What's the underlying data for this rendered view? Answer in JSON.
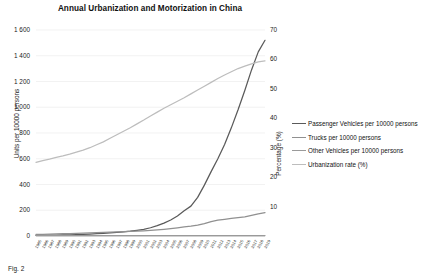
{
  "chart_data": {
    "type": "line",
    "title": "Annual Urbanization and Motorization in China",
    "xlabel": "",
    "ylabel": "Units per 10000 persons",
    "y2label": "Percentage (%)",
    "ylim": [
      0,
      1600
    ],
    "y2lim": [
      0,
      70
    ],
    "grid": true,
    "legend_position": "right",
    "y_ticks": [
      "0",
      "200",
      "400",
      "600",
      "800",
      "1 000",
      "1 200",
      "1 400",
      "1 600"
    ],
    "y2_ticks": [
      "10",
      "20",
      "30",
      "40",
      "50",
      "60",
      "70"
    ],
    "categories": [
      "1985",
      "1986",
      "1987",
      "1988",
      "1989",
      "1990",
      "1991",
      "1992",
      "1993",
      "1994",
      "1995",
      "1996",
      "1997",
      "1998",
      "1999",
      "2000",
      "2001",
      "2002",
      "2003",
      "2004",
      "2005",
      "2006",
      "2007",
      "2008",
      "2009",
      "2010",
      "2011",
      "2012",
      "2013",
      "2014",
      "2015",
      "2016",
      "2017",
      "2018",
      "2019"
    ],
    "series": [
      {
        "name": "Passenger Vehicles per 10000 persons",
        "axis": "left",
        "color": "#5a5a5a",
        "values": [
          4,
          5,
          6,
          7,
          8,
          9,
          10,
          12,
          15,
          18,
          21,
          24,
          28,
          32,
          37,
          44,
          52,
          64,
          80,
          100,
          124,
          155,
          196,
          232,
          300,
          395,
          500,
          600,
          710,
          840,
          980,
          1130,
          1290,
          1430,
          1520
        ]
      },
      {
        "name": "Trucks per 10000 persons",
        "axis": "left",
        "color": "#909090",
        "values": [
          12,
          13,
          15,
          16,
          18,
          19,
          20,
          22,
          24,
          26,
          28,
          30,
          32,
          34,
          36,
          38,
          40,
          43,
          47,
          52,
          58,
          64,
          70,
          76,
          84,
          96,
          112,
          124,
          130,
          136,
          142,
          148,
          160,
          172,
          182
        ]
      },
      {
        "name": "Other Vehicles per 10000 persons",
        "axis": "left",
        "color": "#9a9a9a",
        "values": [
          3,
          3,
          3,
          3,
          3,
          3,
          3,
          3,
          3,
          3,
          3,
          3,
          3,
          3,
          3,
          3,
          3,
          3,
          3,
          3,
          3,
          3,
          3,
          3,
          3,
          3,
          3,
          3,
          3,
          3,
          3,
          3,
          3,
          3,
          3
        ]
      },
      {
        "name": "Urbanization rate (%)",
        "axis": "right",
        "color": "#bdbdbd",
        "values": [
          25.0,
          25.6,
          26.1,
          26.7,
          27.2,
          27.8,
          28.5,
          29.2,
          30.0,
          31.0,
          32.0,
          33.2,
          34.4,
          35.6,
          36.8,
          38.1,
          39.4,
          40.8,
          42.1,
          43.4,
          44.6,
          45.8,
          47.0,
          48.3,
          49.6,
          50.9,
          52.2,
          53.5,
          54.7,
          55.8,
          56.9,
          57.7,
          58.5,
          59.2,
          59.5
        ]
      }
    ]
  },
  "caption": {
    "text": "Fig. 2"
  }
}
